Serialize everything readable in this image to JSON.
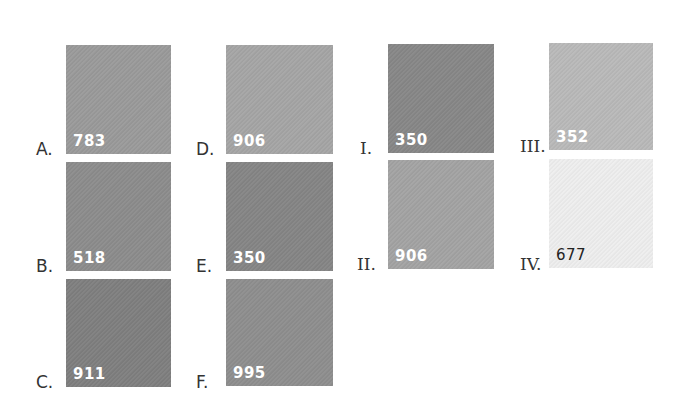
{
  "swatches": {
    "A": {
      "label": "A.",
      "code": "783",
      "color": "#9a9a9a"
    },
    "B": {
      "label": "B.",
      "code": "518",
      "color": "#8c8c8c"
    },
    "C": {
      "label": "C.",
      "code": "911",
      "color": "#7f7f7f"
    },
    "D": {
      "label": "D.",
      "code": "906",
      "color": "#a5a5a5"
    },
    "E": {
      "label": "E.",
      "code": "350",
      "color": "#858585"
    },
    "F": {
      "label": "F.",
      "code": "995",
      "color": "#8e8e8e"
    },
    "I": {
      "label": "I.",
      "code": "350",
      "color": "#878787"
    },
    "II": {
      "label": "II.",
      "code": "906",
      "color": "#a3a3a3"
    },
    "III": {
      "label": "III.",
      "code": "352",
      "color": "#b9b9b9"
    },
    "IV": {
      "label": "IV.",
      "code": "677",
      "color": "#eeeeee"
    }
  }
}
